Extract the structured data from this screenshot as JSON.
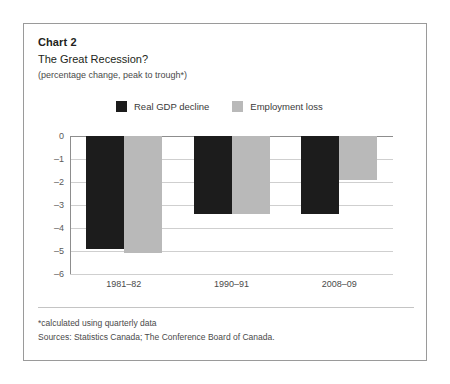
{
  "header": {
    "chart_number": "Chart 2",
    "title": "The Great Recession?",
    "subtitle": "(percentage change, peak to trough*)"
  },
  "legend": {
    "items": [
      {
        "label": "Real GDP decline",
        "color": "#1c1c1c",
        "swatch_name": "legend-swatch-real-gdp-decline"
      },
      {
        "label": "Employment loss",
        "color": "#b9b9b9",
        "swatch_name": "legend-swatch-employment-loss"
      }
    ]
  },
  "footnotes": {
    "note": "*calculated using quarterly data",
    "sources": "Sources: Statistics Canada; The Conference Board of Canada."
  },
  "chart_data": {
    "type": "bar",
    "title": "The Great Recession?",
    "subtitle": "(percentage change, peak to trough*)",
    "categories": [
      "1981–82",
      "1990–91",
      "2008–09"
    ],
    "series": [
      {
        "name": "Real GDP decline",
        "color": "#1c1c1c",
        "values": [
          -4.9,
          -3.4,
          -3.4
        ]
      },
      {
        "name": "Employment loss",
        "color": "#b9b9b9",
        "values": [
          -5.1,
          -3.4,
          -1.9
        ]
      }
    ],
    "xlabel": "",
    "ylabel": "",
    "ylim": [
      -6,
      0
    ],
    "yticks": [
      0,
      -1,
      -2,
      -3,
      -4,
      -5,
      -6
    ],
    "ytick_labels": [
      "0",
      "–1",
      "–2",
      "–3",
      "–4",
      "–5",
      "–6"
    ],
    "grid": true,
    "legend_position": "top-center"
  }
}
